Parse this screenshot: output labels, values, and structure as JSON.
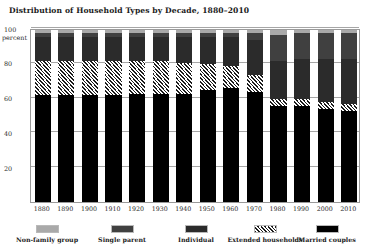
{
  "chart_data": {
    "type": "bar",
    "subtype": "stacked-100-percent",
    "title": "Distribution of Household Types by Decade, 1880–2010",
    "xlabel": "",
    "ylabel": "percent",
    "ylim": [
      0,
      100
    ],
    "yticks": [
      20,
      40,
      60,
      80,
      100
    ],
    "ytick_labels": [
      "20",
      "40",
      "60",
      "80",
      "100"
    ],
    "y_unit_label": "percent",
    "grid": true,
    "legend_position": "bottom",
    "categories": [
      "1880",
      "1890",
      "1900",
      "1910",
      "1920",
      "1930",
      "1940",
      "1950",
      "1960",
      "1970",
      "1980",
      "1990",
      "2000",
      "2010"
    ],
    "stack_order_bottom_to_top": [
      "Married couples",
      "Extended households",
      "Individual",
      "Single parent",
      "Non-family group"
    ],
    "series": [
      {
        "name": "Married couples",
        "color": "#000000",
        "pattern": "solid",
        "values": [
          62,
          62,
          62,
          62,
          63,
          63,
          63,
          65,
          66,
          64,
          56,
          56,
          54,
          53
        ]
      },
      {
        "name": "Extended households",
        "color": "#ffffff",
        "pattern": "diagonal-hatch",
        "values": [
          20,
          20,
          20,
          20,
          19,
          19,
          18,
          15,
          13,
          10,
          4,
          4,
          4,
          4
        ]
      },
      {
        "name": "Individual",
        "color": "#2b2b2b",
        "pattern": "solid",
        "values": [
          14,
          14,
          14,
          14,
          14,
          14,
          15,
          16,
          17,
          20,
          22,
          23,
          25,
          26
        ]
      },
      {
        "name": "Single parent",
        "color": "#404040",
        "pattern": "solid",
        "values": [
          2,
          2,
          2,
          2,
          2,
          2,
          2,
          2,
          2,
          4,
          15,
          15,
          15,
          15
        ]
      },
      {
        "name": "Non-family group",
        "color": "#a9a9a9",
        "pattern": "solid",
        "values": [
          2,
          2,
          2,
          2,
          2,
          2,
          2,
          2,
          2,
          2,
          3,
          2,
          2,
          2
        ]
      }
    ],
    "legend_entries": [
      {
        "label": "Non-family group",
        "swatch_class": "sw-nonfamily",
        "name": "non-family-group"
      },
      {
        "label": "Single parent",
        "swatch_class": "sw-singleparent",
        "name": "single-parent"
      },
      {
        "label": "Individual",
        "swatch_class": "sw-individual",
        "name": "individual"
      },
      {
        "label": "Extended households",
        "swatch_class": "sw-extended",
        "name": "extended-households"
      },
      {
        "label": "Married couples",
        "swatch_class": "sw-married",
        "name": "married-couples"
      }
    ]
  }
}
